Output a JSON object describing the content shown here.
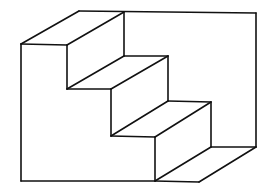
{
  "figure": {
    "width": 267,
    "height": 194,
    "background": "#ffffff",
    "stroke_color": "#111111"
  },
  "edges": {
    "outer": [
      {
        "name": "left-wall-edge",
        "x1": 21,
        "y1": 44,
        "x2": 21,
        "y2": 181
      },
      {
        "name": "bottom-edge",
        "x1": 21,
        "y1": 181,
        "x2": 155,
        "y2": 181
      },
      {
        "name": "top-back-edge",
        "x1": 79,
        "y1": 11,
        "x2": 256,
        "y2": 13
      },
      {
        "name": "right-wall-edge",
        "x1": 256,
        "y1": 13,
        "x2": 256,
        "y2": 147
      },
      {
        "name": "top-left-diagonal",
        "x1": 21,
        "y1": 44,
        "x2": 79,
        "y2": 11
      }
    ],
    "steps": [
      {
        "name": "step1-top-front",
        "x1": 21,
        "y1": 44,
        "x2": 67,
        "y2": 45
      },
      {
        "name": "step1-top-diagonal",
        "x1": 67,
        "y1": 45,
        "x2": 124,
        "y2": 12
      },
      {
        "name": "step1-back-riser",
        "x1": 124,
        "y1": 12,
        "x2": 124,
        "y2": 56
      },
      {
        "name": "step1-front-riser",
        "x1": 67,
        "y1": 45,
        "x2": 67,
        "y2": 89
      },
      {
        "name": "step2-tread-back",
        "x1": 124,
        "y1": 56,
        "x2": 168,
        "y2": 56
      },
      {
        "name": "step2-tread-diagonal",
        "x1": 67,
        "y1": 89,
        "x2": 124,
        "y2": 56
      },
      {
        "name": "step2-tread-front",
        "x1": 67,
        "y1": 89,
        "x2": 111,
        "y2": 89
      },
      {
        "name": "step2-front-diagonal",
        "x1": 111,
        "y1": 89,
        "x2": 168,
        "y2": 56
      },
      {
        "name": "step2-front-riser",
        "x1": 111,
        "y1": 89,
        "x2": 111,
        "y2": 136
      },
      {
        "name": "step2-back-riser",
        "x1": 168,
        "y1": 56,
        "x2": 168,
        "y2": 101
      },
      {
        "name": "step3-tread-back",
        "x1": 168,
        "y1": 101,
        "x2": 211,
        "y2": 102
      },
      {
        "name": "step3-tread-diagonal",
        "x1": 111,
        "y1": 136,
        "x2": 168,
        "y2": 101
      },
      {
        "name": "step3-tread-front",
        "x1": 111,
        "y1": 136,
        "x2": 155,
        "y2": 137
      },
      {
        "name": "step3-front-diagonal",
        "x1": 155,
        "y1": 137,
        "x2": 211,
        "y2": 102
      },
      {
        "name": "step3-front-riser",
        "x1": 155,
        "y1": 137,
        "x2": 155,
        "y2": 181
      },
      {
        "name": "step3-back-riser",
        "x1": 211,
        "y1": 102,
        "x2": 211,
        "y2": 147
      },
      {
        "name": "floor-back",
        "x1": 211,
        "y1": 147,
        "x2": 256,
        "y2": 147
      },
      {
        "name": "floor-diagonal",
        "x1": 155,
        "y1": 181,
        "x2": 211,
        "y2": 147
      },
      {
        "name": "floor-front",
        "x1": 155,
        "y1": 181,
        "x2": 199,
        "y2": 182
      },
      {
        "name": "floor-front-diagonal",
        "x1": 199,
        "y1": 182,
        "x2": 256,
        "y2": 147
      }
    ]
  }
}
